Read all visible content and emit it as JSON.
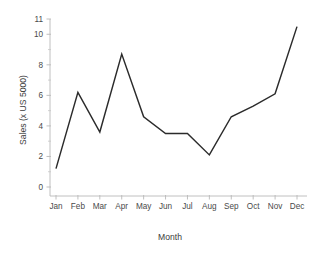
{
  "chart_data": {
    "type": "line",
    "title": "",
    "xlabel": "Month",
    "ylabel": "Sales (x US 5000)",
    "categories": [
      "Jan",
      "Feb",
      "Mar",
      "Apr",
      "May",
      "Jun",
      "Jul",
      "Aug",
      "Sep",
      "Oct",
      "Nov",
      "Dec"
    ],
    "values": [
      1.2,
      6.2,
      3.6,
      8.7,
      4.6,
      3.5,
      3.5,
      2.1,
      4.6,
      5.3,
      6.1,
      10.5
    ],
    "series": [
      {
        "name": "Sales",
        "values": [
          1.2,
          6.2,
          3.6,
          8.7,
          4.6,
          3.5,
          3.5,
          2.1,
          4.6,
          5.3,
          6.1,
          10.5
        ]
      }
    ],
    "ylim": [
      0,
      11
    ],
    "ytick_labels": [
      "0",
      "2",
      "4",
      "6",
      "8",
      "10",
      "11"
    ],
    "ytick_values": [
      0,
      2,
      4,
      6,
      8,
      10,
      11
    ],
    "yminor_values": [
      1,
      3,
      5,
      7,
      9
    ],
    "grid": false,
    "legend": false,
    "legend_position": "none",
    "line_color": "#2b2b2b",
    "axis_color": "#b9b9b9",
    "background_color": "#ffffff"
  }
}
